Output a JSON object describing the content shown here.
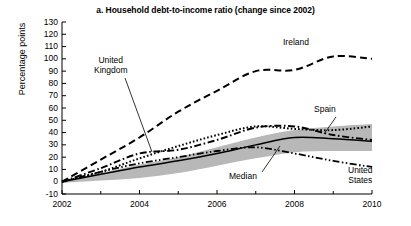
{
  "chart_data": {
    "type": "line",
    "title": "a. Household debt-to-income ratio (change since 2002)",
    "xlabel": "",
    "ylabel": "Percentage points",
    "xlim": [
      2002,
      2010
    ],
    "ylim": [
      -10,
      130
    ],
    "ytick_step": 10,
    "yticks": [
      -10,
      0,
      10,
      20,
      30,
      40,
      50,
      60,
      70,
      80,
      90,
      100,
      110,
      120,
      130
    ],
    "xticks_major": [
      2002,
      2004,
      2006,
      2008,
      2010
    ],
    "xticks_minor": [
      2003,
      2005,
      2007,
      2009
    ],
    "grid": false,
    "legend": "annotations-inline",
    "x": [
      2002,
      2003,
      2004,
      2005,
      2006,
      2007,
      2008,
      2009,
      2010
    ],
    "series": [
      {
        "name": "Ireland",
        "style": "dashed",
        "color": "#000000",
        "values": [
          0,
          18,
          36,
          57,
          74,
          90,
          91,
          102,
          100
        ]
      },
      {
        "name": "Spain",
        "style": "dotted",
        "color": "#000000",
        "values": [
          0,
          8,
          19,
          29,
          38,
          45,
          43,
          42,
          45
        ]
      },
      {
        "name": "United Kingdom",
        "style": "dash-dot",
        "color": "#000000",
        "values": [
          0,
          11,
          23,
          26,
          34,
          44,
          45,
          38,
          34
        ]
      },
      {
        "name": "United States",
        "style": "dash-dot-dot",
        "color": "#000000",
        "values": [
          0,
          8,
          15,
          20,
          25,
          28,
          23,
          17,
          12
        ]
      },
      {
        "name": "Median",
        "style": "solid",
        "color": "#000000",
        "values": [
          0,
          6,
          12,
          17,
          23,
          30,
          36,
          35,
          33
        ]
      }
    ],
    "band": {
      "name": "Interquartile range",
      "color": "#b8b8b8",
      "upper": [
        0,
        7,
        14,
        20,
        28,
        36,
        42,
        45,
        47
      ],
      "lower": [
        -1,
        1,
        3,
        7,
        13,
        19,
        24,
        25,
        25
      ]
    },
    "annotations": [
      {
        "name": "United Kingdom",
        "text": "United\nKingdom"
      },
      {
        "name": "Ireland",
        "text": "Ireland"
      },
      {
        "name": "Spain",
        "text": "Spain"
      },
      {
        "name": "Median",
        "text": "Median"
      },
      {
        "name": "United States",
        "text": "United\nStates"
      }
    ]
  },
  "axis": {
    "ylabel": "Percentage points",
    "ytick_labels": [
      "130",
      "120",
      "110",
      "100",
      "90",
      "80",
      "70",
      "60",
      "50",
      "40",
      "30",
      "20",
      "10",
      "0",
      "-10"
    ],
    "xtick_labels": [
      "2002",
      "2004",
      "2006",
      "2008",
      "2010"
    ]
  },
  "labels": {
    "title": "a. Household debt-to-income ratio (change since 2002)",
    "united_kingdom_l1": "United",
    "united_kingdom_l2": "Kingdom",
    "ireland": "Ireland",
    "spain": "Spain",
    "median": "Median",
    "united_states_l1": "United",
    "united_states_l2": "States"
  }
}
